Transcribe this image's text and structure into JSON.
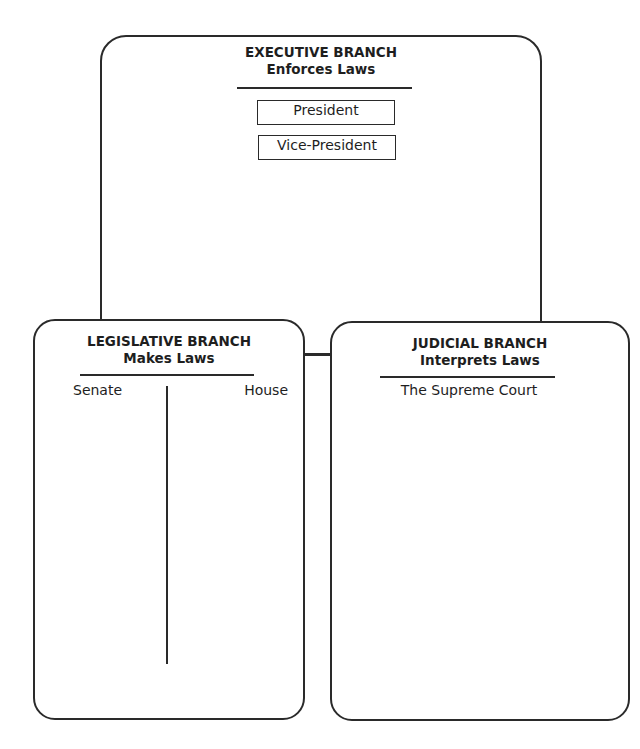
{
  "diagram": {
    "executive": {
      "title": "EXECUTIVE BRANCH",
      "subtitle": "Enforces Laws",
      "members": [
        "President",
        "Vice-President"
      ]
    },
    "legislative": {
      "title": "LEGISLATIVE BRANCH",
      "subtitle": "Makes Laws",
      "columns": [
        "Senate",
        "House"
      ]
    },
    "judicial": {
      "title": "JUDICIAL BRANCH",
      "subtitle": "Interprets Laws",
      "members": [
        "The Supreme Court"
      ]
    }
  }
}
